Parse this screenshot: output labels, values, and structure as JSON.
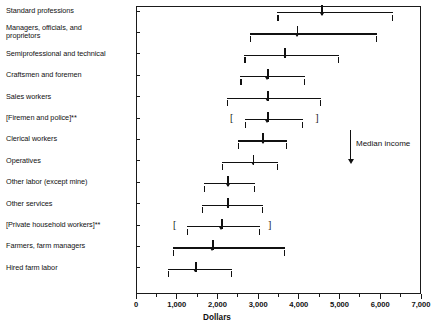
{
  "chart_data": {
    "type": "bar",
    "title": "",
    "subtitle": "",
    "xlabel": "Dollars",
    "ylabel": "",
    "xlim": [
      0,
      7000
    ],
    "xticks": [
      0,
      1000,
      2000,
      3000,
      4000,
      5000,
      6000,
      7000
    ],
    "xticklabels": [
      "0",
      "1,000",
      "2,000",
      "3,000",
      "4,000",
      "5,000",
      "6,000",
      "7,000"
    ],
    "xtick_minor_step": 500,
    "grid": false,
    "legend": null,
    "orientation": "horizontal",
    "marker_meaning": "Median income",
    "annotations": [
      {
        "text": "Median income",
        "x": 5250,
        "note": "downward arrow pointing to median markers"
      }
    ],
    "footnote_symbol": "**",
    "categories": [
      "Standard professions",
      "Managers, officials, and\n    proprietors",
      "Semiprofessional and technical",
      "Craftsmen and foremen",
      "Sales workers",
      "[Firemen and police]**",
      "Clerical workers",
      "Operatives",
      "Other labor (except mine)",
      "Other services",
      "[Private household workers]**",
      "Farmers, farm managers",
      "Hired farm labor"
    ],
    "series": [
      {
        "name": "Income range with median",
        "points": [
          {
            "category": "Standard professions",
            "low": 3470,
            "high": 6320,
            "median": 4570,
            "bracketed": false
          },
          {
            "category": "Managers, officials, and proprietors",
            "low": 2800,
            "high": 5920,
            "median": 3960,
            "bracketed": false
          },
          {
            "category": "Semiprofessional and technical",
            "low": 2660,
            "high": 4990,
            "median": 3660,
            "bracketed": false
          },
          {
            "category": "Craftsmen and foremen",
            "low": 2560,
            "high": 4150,
            "median": 3240,
            "bracketed": false
          },
          {
            "category": "Sales workers",
            "low": 2240,
            "high": 4540,
            "median": 3240,
            "bracketed": false
          },
          {
            "category": "[Firemen and police]**",
            "low": 2680,
            "high": 4100,
            "median": 3240,
            "bracketed": true,
            "bracket_low": 2360,
            "bracket_high": 4450
          },
          {
            "category": "Clerical workers",
            "low": 2510,
            "high": 3710,
            "median": 3120,
            "bracketed": false
          },
          {
            "category": "Operatives",
            "low": 2110,
            "high": 3490,
            "median": 2880,
            "bracketed": false
          },
          {
            "category": "Other labor (except mine)",
            "low": 1670,
            "high": 2920,
            "median": 2260,
            "bracketed": false
          },
          {
            "category": "Other services",
            "low": 1620,
            "high": 3120,
            "median": 2260,
            "bracketed": false
          },
          {
            "category": "[Private household workers]**",
            "low": 1250,
            "high": 3050,
            "median": 2110,
            "bracketed": true,
            "bracket_low": 960,
            "bracket_high": 3290
          },
          {
            "category": "Farmers, farm managers",
            "low": 910,
            "high": 3660,
            "median": 1890,
            "bracketed": false
          },
          {
            "category": "Hired farm labor",
            "low": 790,
            "high": 2360,
            "median": 1470,
            "bracketed": false
          }
        ]
      }
    ]
  },
  "colors": {
    "ink": "#1a1a1a",
    "background": "#ffffff"
  }
}
